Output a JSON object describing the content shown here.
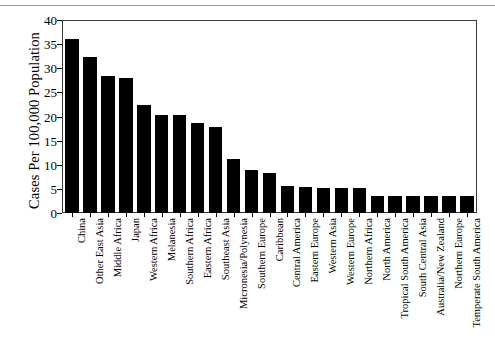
{
  "chart_data": {
    "type": "bar",
    "title": "",
    "xlabel": "",
    "ylabel": "Cases Per 100,000 Population",
    "ylim": [
      0,
      40
    ],
    "yticks": [
      0,
      5,
      10,
      15,
      20,
      25,
      30,
      35,
      40
    ],
    "grid": false,
    "legend": null,
    "bar_color": "#000000",
    "categories": [
      "China",
      "Other East Asia",
      "Middle Africa",
      "Japan",
      "Western Africa",
      "Melanesia",
      "Southern Africa",
      "Eastern Africa",
      "Southeast Asia",
      "Micronesia/Polynesia",
      "Southern Europe",
      "Caribbean",
      "Central America",
      "Eastern Europe",
      "Western Asia",
      "Western Europe",
      "Northern Africa",
      "North America",
      "Tropical South America",
      "South Central Asia",
      "Australia/New Zealand",
      "Northern Europe",
      "Temperate South America"
    ],
    "values": [
      36.0,
      32.4,
      28.5,
      27.9,
      22.3,
      20.3,
      20.3,
      18.7,
      17.8,
      11.2,
      8.9,
      8.3,
      5.6,
      5.3,
      5.2,
      5.2,
      5.2,
      3.6,
      3.6,
      3.6,
      3.6,
      3.6,
      3.6
    ]
  },
  "axis": {
    "y_title": "Cases Per 100,000 Population",
    "y_tick_labels": [
      "40",
      "35",
      "30",
      "25",
      "20",
      "15",
      "10",
      "5",
      "0"
    ]
  }
}
